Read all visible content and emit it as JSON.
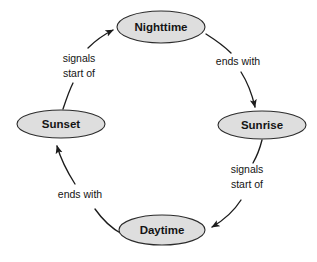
{
  "diagram": {
    "type": "cycle-diagram",
    "background_color": "#ffffff",
    "node_fill_color": "#dedede",
    "node_stroke_color": "#2b2b2b",
    "edge_color": "#1c1c1c",
    "text_color": "#141414",
    "nodes": [
      {
        "id": "nighttime",
        "label": "Nighttime",
        "cx": 161,
        "cy": 27,
        "rx": 44,
        "ry": 16
      },
      {
        "id": "sunrise",
        "label": "Sunrise",
        "cx": 262,
        "cy": 125,
        "rx": 44,
        "ry": 14
      },
      {
        "id": "daytime",
        "label": "Daytime",
        "cx": 162,
        "cy": 230,
        "rx": 43,
        "ry": 15
      },
      {
        "id": "sunset",
        "label": "Sunset",
        "cx": 61,
        "cy": 124,
        "rx": 44,
        "ry": 14
      }
    ],
    "edges": [
      {
        "id": "nighttime-to-sunrise",
        "from": "nighttime",
        "to": "sunrise",
        "label_line1": "ends with",
        "label_line2": "",
        "label_x": 238,
        "label_y": 62
      },
      {
        "id": "sunrise-to-daytime",
        "from": "sunrise",
        "to": "daytime",
        "label_line1": "signals",
        "label_line2": "start of",
        "label_x": 247,
        "label_y": 176
      },
      {
        "id": "daytime-to-sunset",
        "from": "daytime",
        "to": "sunset",
        "label_line1": "ends with",
        "label_line2": "",
        "label_x": 80,
        "label_y": 195
      },
      {
        "id": "sunset-to-nighttime",
        "from": "sunset",
        "to": "nighttime",
        "label_line1": "signals",
        "label_line2": "start of",
        "label_x": 79,
        "label_y": 65
      }
    ]
  }
}
